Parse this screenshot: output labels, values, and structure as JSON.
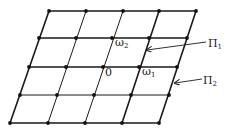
{
  "diagram": {
    "type": "period-lattice",
    "colors": {
      "line": "#1a1a1a",
      "dot": "#111111",
      "background": "#ffffff"
    },
    "grid": {
      "rows": 5,
      "cols": 5,
      "points": [
        [
          [
            49,
            11
          ],
          [
            86,
            11
          ],
          [
            123,
            11
          ],
          [
            159,
            11
          ],
          [
            196,
            11
          ]
        ],
        [
          [
            39,
            38
          ],
          [
            76,
            38
          ],
          [
            112,
            38
          ],
          [
            149,
            38
          ],
          [
            187,
            38
          ]
        ],
        [
          [
            29,
            67
          ],
          [
            66,
            67
          ],
          [
            103,
            67
          ],
          [
            139,
            67
          ],
          [
            177,
            67
          ]
        ],
        [
          [
            20,
            95
          ],
          [
            57,
            95
          ],
          [
            94,
            95
          ],
          [
            131,
            95
          ],
          [
            169,
            95
          ]
        ],
        [
          [
            10,
            123
          ],
          [
            48,
            123
          ],
          [
            85,
            123
          ],
          [
            122,
            123
          ],
          [
            159,
            123
          ]
        ]
      ]
    },
    "labels": {
      "origin": "0",
      "omega1": {
        "base": "ω",
        "sub": "1"
      },
      "omega2": {
        "base": "ω",
        "sub": "2"
      },
      "pi1": {
        "base": "Π",
        "sub": "1"
      },
      "pi2": {
        "base": "Π",
        "sub": "2"
      }
    },
    "arrows": {
      "pi1": {
        "from": [
          206,
          42
        ],
        "to": [
          147,
          50
        ]
      },
      "pi2": {
        "from": [
          202,
          79
        ],
        "to": [
          175,
          83
        ]
      }
    }
  }
}
